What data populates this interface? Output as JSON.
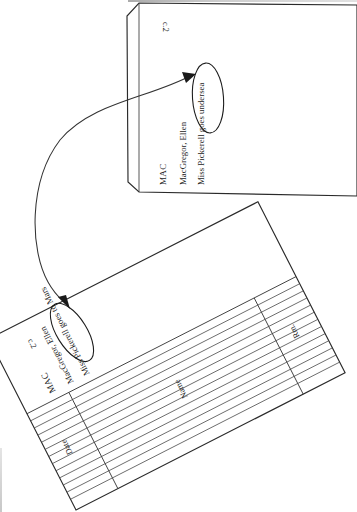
{
  "page": {
    "background_color": "#ffffff",
    "ink_color": "#1b1b1b",
    "orientation": "rotated-sideways-scan",
    "width": 357,
    "height": 512
  },
  "cards": [
    {
      "id": "card-top",
      "role": "catalog-card-undersea",
      "copy_mark": "c.2",
      "call_number": "MAC",
      "author": "MacGregor, Ellen",
      "title_prefix": "Miss Pickerell ",
      "title_circled": "goes undersea",
      "title_full": "Miss Pickerell goes undersea",
      "has_circle": true,
      "has_ruled_grid": false
    },
    {
      "id": "card-bottom",
      "role": "catalog-card-mars",
      "copy_mark": "c.2",
      "call_number": "MAC",
      "author": "MacGregor, Ellen",
      "title_prefix": "Miss Pickerell ",
      "title_circled": "goes to Mars",
      "title_full": "Miss Pickerell goes to Mars",
      "has_circle": true,
      "has_ruled_grid": true,
      "columns": [
        {
          "label": "Date"
        },
        {
          "label": "Name"
        },
        {
          "label": "Rm."
        }
      ],
      "ruled_row_count": 13
    }
  ],
  "annotation": {
    "type": "curved-arrow",
    "description": "Sweeping curved double-headed arrow linking the two circled title phrases",
    "stroke_color": "#333333",
    "arrowheads": 2,
    "from": "goes to Mars",
    "to": "goes undersea"
  }
}
